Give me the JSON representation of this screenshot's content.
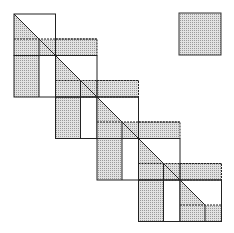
{
  "diagram": {
    "type": "block-staircase-matrix",
    "colors": {
      "background": "#ffffff",
      "line": "#222222",
      "shade": "#d4d4d4",
      "shade_dot": "#9a9a9a"
    },
    "steps": 5,
    "step_size": 41.5,
    "origin": [
      14,
      14
    ],
    "legend_square": {
      "x": 179,
      "y": 13,
      "w": 42,
      "h": 42
    }
  }
}
